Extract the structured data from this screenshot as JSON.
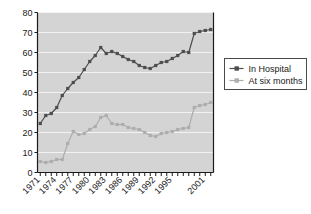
{
  "chart_data": {
    "type": "line",
    "title": "",
    "subtitle": "",
    "xlabel": "",
    "ylabel": "",
    "xlim": [
      1971,
      2002
    ],
    "ylim": [
      0,
      80
    ],
    "yticks": [
      0,
      10,
      20,
      30,
      40,
      50,
      60,
      70,
      80
    ],
    "grid": true,
    "grid_axis": "y",
    "legend_position": "right",
    "x": [
      1971,
      1972,
      1973,
      1974,
      1975,
      1976,
      1977,
      1978,
      1979,
      1980,
      1981,
      1982,
      1983,
      1984,
      1985,
      1986,
      1987,
      1988,
      1989,
      1990,
      1991,
      1992,
      1993,
      1994,
      1995,
      1996,
      1997,
      1998,
      1999,
      2000,
      2001,
      2002
    ],
    "xtick_labels": [
      "1971",
      "1974",
      "1977",
      "1980",
      "1983",
      "1986",
      "1989",
      "1992",
      "1995",
      "2001"
    ],
    "xtick_label_values": [
      1971,
      1974,
      1977,
      1980,
      1983,
      1986,
      1989,
      1992,
      1995,
      2001
    ],
    "xtick_rotation": -45,
    "series": [
      {
        "name": "In Hospital",
        "color": "#4d4d4d",
        "marker": "square",
        "values": [
          24.5,
          28.5,
          29.5,
          32.5,
          38.5,
          42,
          45,
          47.5,
          51.5,
          55.5,
          58.5,
          62.5,
          59.5,
          60.5,
          59.5,
          58,
          56.5,
          55.5,
          53.5,
          52.5,
          52,
          53.5,
          55,
          55.5,
          57,
          58.5,
          60.5,
          60,
          69.5,
          70.5,
          71,
          71.5
        ]
      },
      {
        "name": "At six months",
        "color": "#adadad",
        "marker": "square",
        "values": [
          5.5,
          5,
          5.5,
          6.5,
          6.5,
          14.5,
          20.5,
          19,
          19.5,
          21.5,
          23,
          27.5,
          28.5,
          24.5,
          24,
          24,
          22.5,
          22,
          21.5,
          20,
          18.5,
          18,
          19.5,
          20,
          20.5,
          21.5,
          22,
          22.5,
          32.5,
          33.5,
          34,
          35
        ]
      }
    ]
  },
  "legend": {
    "items": [
      {
        "label": "In Hospital",
        "color": "#4d4d4d"
      },
      {
        "label": "At six months",
        "color": "#adadad"
      }
    ]
  },
  "axes": {
    "y_labels": [
      "80",
      "70",
      "60",
      "50",
      "40",
      "30",
      "20",
      "10",
      "0"
    ],
    "x_labels": [
      "1971",
      "1974",
      "1977",
      "1980",
      "1983",
      "1986",
      "1989",
      "1992",
      "1995",
      "2001"
    ]
  },
  "colors": {
    "plot_background": "#d4d4d4",
    "page_background": "#ffffff",
    "gridline": "#f2f2f2",
    "axis": "#1a1a1a",
    "series_dark": "#4d4d4d",
    "series_light": "#adadad"
  }
}
